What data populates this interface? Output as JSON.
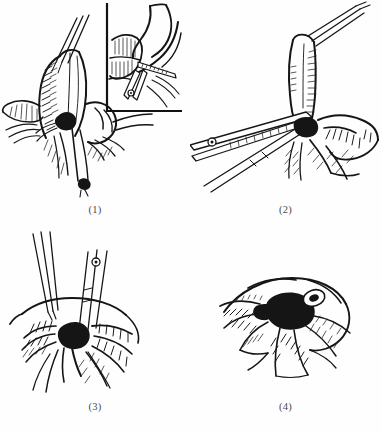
{
  "figure": {
    "medium": "pen-and-ink line illustration",
    "background_color": "#fefefe",
    "ink_color": "#151515",
    "panel_count": 4,
    "layout": "2 x 2 grid"
  },
  "panels": [
    {
      "id": "panel-1",
      "caption": "(1)",
      "label_number": "1",
      "description": "Appendix elevated and held with forceps; mesoappendix and base exposed, ligature placed at base",
      "has_inset": true,
      "inset": {
        "name": "inset-detail-box",
        "frame_style": "L-shaped rule (left and bottom borders)",
        "description": "Magnified detail of the appendiceal base with crushing clamp applied"
      },
      "elements": [
        "appendix",
        "mesoappendix",
        "cecum",
        "tissue-forceps",
        "ligature-suture"
      ]
    },
    {
      "id": "panel-2",
      "caption": "(2)",
      "label_number": "2",
      "description": "Crushing clamp applied across the base of the appendix while the organ is held upright by forceps",
      "has_inset": false,
      "elements": [
        "appendix",
        "crushing-clamp",
        "hinge-screw",
        "tissue-forceps",
        "cecum"
      ]
    },
    {
      "id": "panel-3",
      "caption": "(3)",
      "label_number": "3",
      "description": "Appendiceal stump ligated and grasped; two instruments converge on the ligated stump at the cecal wall",
      "has_inset": false,
      "elements": [
        "appendiceal-stump",
        "tissue-forceps",
        "needle-holder",
        "hinge-screw",
        "ligature-knot",
        "cecum"
      ]
    },
    {
      "id": "panel-4",
      "caption": "(4)",
      "label_number": "4",
      "description": "Completed purse-string closure; stump inverted into the cecum leaving a dark puckered knot at the centre",
      "has_inset": false,
      "elements": [
        "cecum",
        "purse-string-suture",
        "inverted-stump-knot"
      ]
    }
  ]
}
